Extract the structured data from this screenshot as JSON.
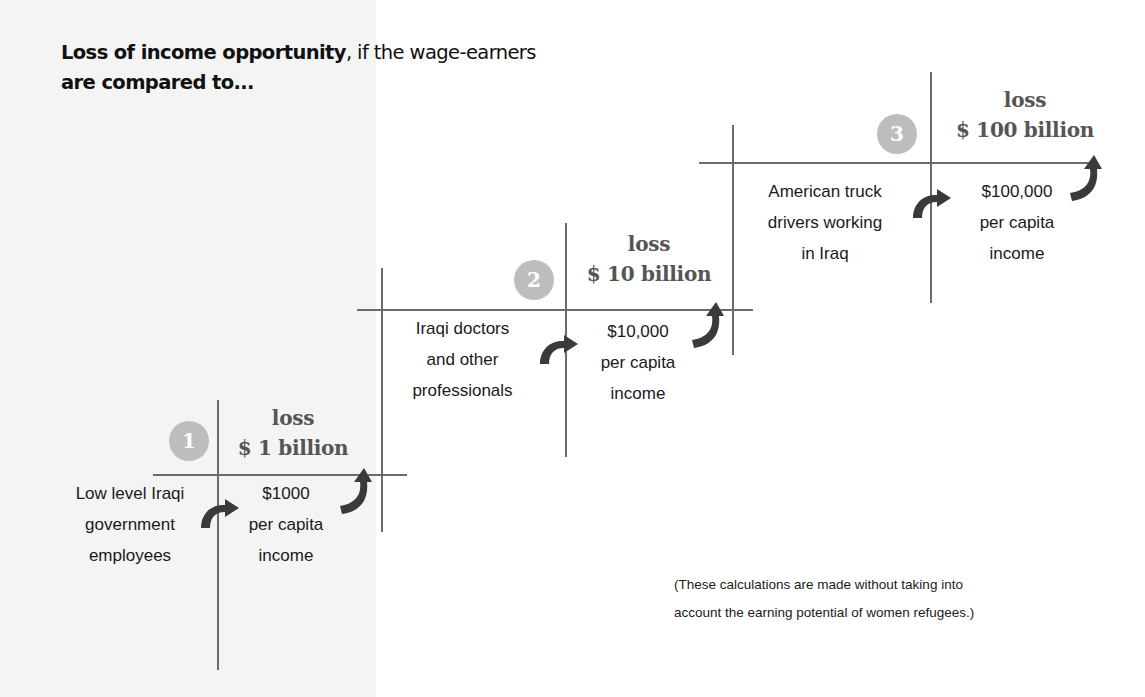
{
  "title": {
    "bold_part": "Loss of income opportunity",
    "normal_part": ", if the wage-earners",
    "line2": "are compared to..."
  },
  "steps": [
    {
      "number": "1",
      "loss_label": "loss",
      "loss_amount": "$ 1 billion",
      "group_lines": [
        "Low level Iraqi",
        "government",
        "employees"
      ],
      "income_lines": [
        "$1000",
        "per capita",
        "income"
      ]
    },
    {
      "number": "2",
      "loss_label": "loss",
      "loss_amount": "$ 10 billion",
      "group_lines": [
        "Iraqi doctors",
        "and other",
        "professionals"
      ],
      "income_lines": [
        "$10,000",
        "per capita",
        "income"
      ]
    },
    {
      "number": "3",
      "loss_label": "loss",
      "loss_amount": "$ 100 billion",
      "group_lines": [
        "American truck",
        "drivers working",
        "in Iraq"
      ],
      "income_lines": [
        "$100,000",
        "per capita",
        "income"
      ]
    }
  ],
  "footnote": {
    "line1": "(These calculations are made without taking into",
    "line2": "account the earning potential of women refugees.)"
  },
  "colors": {
    "lines": "#6b6b6b",
    "arrows": "#3a3a3a",
    "circle": "#bdbdbd",
    "loss_text": "#555555",
    "left_panel": "#f4f4f4"
  },
  "icons": [
    "step-number-circle",
    "curved-arrow-right",
    "curved-arrow-up"
  ]
}
